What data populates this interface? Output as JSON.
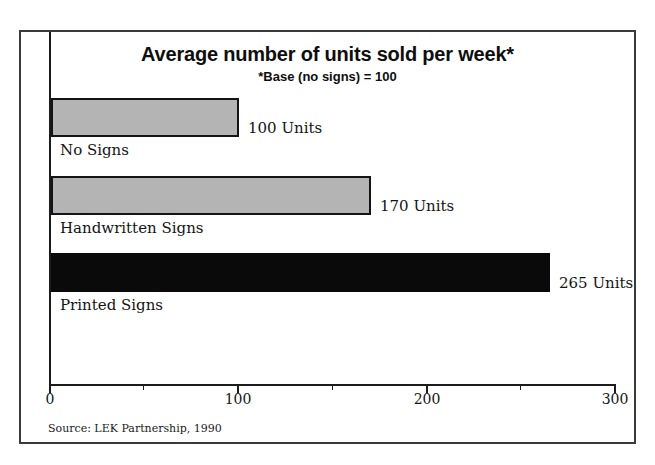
{
  "chart_data": {
    "type": "bar",
    "orientation": "horizontal",
    "title": "Average number of units sold per week*",
    "subtitle": "*Base (no signs) = 100",
    "categories": [
      "No Signs",
      "Handwritten Signs",
      "Printed Signs"
    ],
    "values": [
      100,
      170,
      265
    ],
    "value_labels": [
      "100 Units",
      "170 Units",
      "265 Units"
    ],
    "bar_colors": [
      "#b4b4b4",
      "#b4b4b4",
      "#0a0a0a"
    ],
    "xlim": [
      0,
      300
    ],
    "x_major_tick_labels": [
      "0",
      "100",
      "200",
      "300"
    ],
    "x_major_tick_values": [
      0,
      100,
      200,
      300
    ],
    "x_minor_tick_values": [
      50,
      150,
      250
    ],
    "grid": false,
    "legend": "none",
    "source": "Source: LEK Partnership, 1990"
  },
  "colors": {
    "bar_gray": "#b4b4b4",
    "bar_black": "#0a0a0a",
    "axis": "#1c1c1c",
    "frame_border": "#3a3a3a",
    "background": "#ffffff"
  }
}
